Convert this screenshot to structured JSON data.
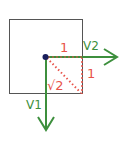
{
  "diagram": {
    "colors": {
      "square": "#555555",
      "vector": "#3d8f3d",
      "measure": "#e8534a",
      "origin": "#1a1f5c"
    },
    "labels": {
      "top_edge": "1",
      "right_edge": "1",
      "diagonal": "√2",
      "v1": "V1",
      "v2": "V2"
    },
    "vectors": [
      {
        "name": "V1",
        "direction": "down"
      },
      {
        "name": "V2",
        "direction": "right"
      }
    ]
  }
}
